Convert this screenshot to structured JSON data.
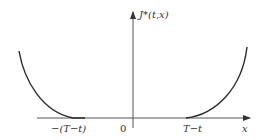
{
  "diagram": {
    "type": "function-plot",
    "axes": {
      "y_label": "J*(t,x)",
      "x_label": "x",
      "origin_label": "0"
    },
    "ticks": {
      "left": "−(T−t)",
      "right": "T−t"
    },
    "colors": {
      "line": "#2a2a2a",
      "axis": "#333333",
      "background": "#ffffff"
    }
  }
}
